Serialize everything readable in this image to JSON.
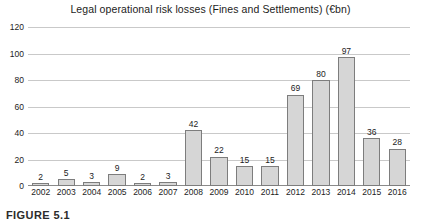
{
  "chart_data": {
    "type": "bar",
    "title": "Legal operational risk losses (Fines and Settlements) (€bn)",
    "xlabel": "",
    "ylabel": "",
    "categories": [
      "2002",
      "2003",
      "2004",
      "2005",
      "2006",
      "2007",
      "2008",
      "2009",
      "2010",
      "2011",
      "2012",
      "2013",
      "2014",
      "2015",
      "2016"
    ],
    "values": [
      2,
      5,
      3,
      9,
      2,
      3,
      42,
      22,
      15,
      15,
      69,
      80,
      97,
      36,
      28
    ],
    "ylim": [
      0,
      120
    ],
    "yticks": [
      0,
      20,
      40,
      60,
      80,
      100,
      120
    ],
    "ytick_labels": [
      "0",
      "20",
      "40",
      "60",
      "80",
      "100",
      "120"
    ],
    "grid": true,
    "legend": false,
    "data_labels": [
      "2",
      "5",
      "3",
      "9",
      "2",
      "3",
      "42",
      "22",
      "15",
      "15",
      "69",
      "80",
      "97",
      "36",
      "28"
    ],
    "bar_color": "#d6d6d6",
    "bar_border_color": "#7d7d7d",
    "gridline_color": "#c9c9c9",
    "axis_color": "#8a8a8a",
    "background": "#ffffff"
  },
  "caption": {
    "label": "FIGURE 5.1"
  }
}
